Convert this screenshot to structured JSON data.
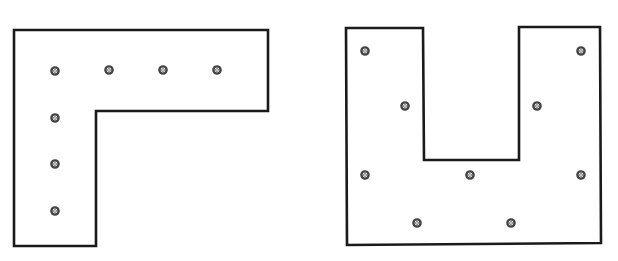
{
  "figure": {
    "background": "#ffffff",
    "stroke_color": "#1a1a1a",
    "hole_color": "#444444",
    "shapes": [
      {
        "name": "l-shaped-plate",
        "points": "14,30 268,30 268,111 96,111 96,246 14,246",
        "holes": [
          {
            "cx": 55,
            "cy": 71
          },
          {
            "cx": 109,
            "cy": 70
          },
          {
            "cx": 163,
            "cy": 70
          },
          {
            "cx": 217,
            "cy": 70
          },
          {
            "cx": 55,
            "cy": 118
          },
          {
            "cx": 55,
            "cy": 164
          },
          {
            "cx": 55,
            "cy": 211
          }
        ]
      },
      {
        "name": "u-shaped-plate",
        "points": "346,28 423,28 424,160 519,160 519,27 600,27 601,243 347,245",
        "holes": [
          {
            "cx": 365,
            "cy": 51
          },
          {
            "cx": 581,
            "cy": 51
          },
          {
            "cx": 405,
            "cy": 106
          },
          {
            "cx": 537,
            "cy": 106
          },
          {
            "cx": 365,
            "cy": 175
          },
          {
            "cx": 470,
            "cy": 175
          },
          {
            "cx": 581,
            "cy": 175
          },
          {
            "cx": 417,
            "cy": 223
          },
          {
            "cx": 511,
            "cy": 223
          }
        ]
      }
    ]
  }
}
